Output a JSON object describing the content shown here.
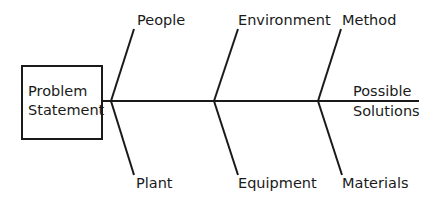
{
  "diagram": {
    "type": "fishbone",
    "problem": {
      "line1": "Problem",
      "line2": "Statement"
    },
    "head": {
      "line1": "Possible",
      "line2": "Solutions"
    },
    "categories_top": [
      "People",
      "Environment",
      "Method"
    ],
    "categories_bottom": [
      "Plant",
      "Equipment",
      "Materials"
    ],
    "line_color": "#1a1a1a"
  }
}
